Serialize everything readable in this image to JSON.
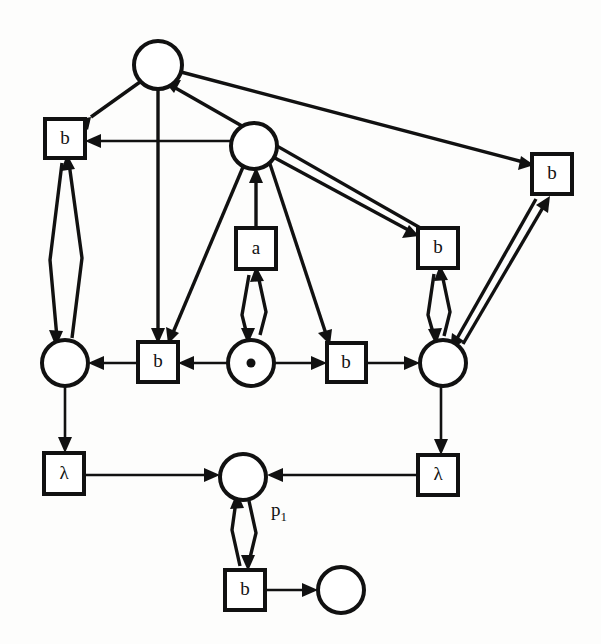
{
  "diagram": {
    "width": 601,
    "height": 644,
    "colors": {
      "stroke": "#111111",
      "fill": "#ffffff",
      "background": "#fdfdfc"
    },
    "places": [
      {
        "id": "p_top",
        "label": "",
        "tokens": 0,
        "cx": 158,
        "cy": 65,
        "r": 24
      },
      {
        "id": "p_mid_upper",
        "label": "",
        "tokens": 0,
        "cx": 254,
        "cy": 146,
        "r": 23
      },
      {
        "id": "p_left",
        "label": "",
        "tokens": 0,
        "cx": 65,
        "cy": 363,
        "r": 23
      },
      {
        "id": "p_token",
        "label": "",
        "tokens": 1,
        "cx": 251,
        "cy": 363,
        "r": 23
      },
      {
        "id": "p_right",
        "label": "",
        "tokens": 0,
        "cx": 443,
        "cy": 363,
        "r": 23
      },
      {
        "id": "p_1",
        "label": "p",
        "sub": "1",
        "tokens": 0,
        "cx": 243,
        "cy": 477,
        "r": 23
      },
      {
        "id": "p_bottom_right",
        "label": "",
        "tokens": 0,
        "cx": 341,
        "cy": 590,
        "r": 23
      }
    ],
    "transitions": [
      {
        "id": "t_b_left_top",
        "label": "b",
        "x": 45,
        "y": 119,
        "w": 40,
        "h": 39
      },
      {
        "id": "t_b_far_right",
        "label": "b",
        "x": 532,
        "y": 154,
        "w": 40,
        "h": 40
      },
      {
        "id": "t_a",
        "label": "a",
        "x": 236,
        "y": 228,
        "w": 40,
        "h": 41
      },
      {
        "id": "t_b_right_upper",
        "label": "b",
        "x": 418,
        "y": 228,
        "w": 40,
        "h": 40
      },
      {
        "id": "t_b_mid_left",
        "label": "b",
        "x": 138,
        "y": 342,
        "w": 40,
        "h": 40
      },
      {
        "id": "t_b_mid_right",
        "label": "b",
        "x": 327,
        "y": 343,
        "w": 39,
        "h": 39
      },
      {
        "id": "t_lambda_left",
        "label": "λ",
        "x": 44,
        "y": 453,
        "w": 40,
        "h": 41
      },
      {
        "id": "t_lambda_right",
        "label": "λ",
        "x": 418,
        "y": 455,
        "w": 40,
        "h": 40
      },
      {
        "id": "t_b_bottom",
        "label": "b",
        "x": 225,
        "y": 570,
        "w": 40,
        "h": 40
      }
    ],
    "arcs": [
      {
        "from": "p_top",
        "to": "t_b_left_top",
        "kind": "directed"
      },
      {
        "from": "p_top",
        "to": "t_b_mid_left",
        "kind": "directed"
      },
      {
        "from": "p_top",
        "to": "t_b_far_right",
        "kind": "directed"
      },
      {
        "from": "t_b_right_upper",
        "to": "p_top",
        "kind": "directed"
      },
      {
        "from": "p_mid_upper",
        "to": "t_b_left_top",
        "kind": "directed"
      },
      {
        "from": "p_mid_upper",
        "to": "t_b_mid_left",
        "kind": "directed"
      },
      {
        "from": "p_mid_upper",
        "to": "t_b_right_upper",
        "kind": "directed"
      },
      {
        "from": "p_mid_upper",
        "to": "t_b_mid_right",
        "kind": "directed"
      },
      {
        "from": "t_a",
        "to": "p_mid_upper",
        "kind": "directed"
      },
      {
        "from": "t_b_left_top",
        "to": "p_left",
        "kind": "bidirectional"
      },
      {
        "from": "t_a",
        "to": "p_token",
        "kind": "bidirectional"
      },
      {
        "from": "t_b_right_upper",
        "to": "p_right",
        "kind": "bidirectional"
      },
      {
        "from": "t_b_far_right",
        "to": "p_right",
        "kind": "bidirectional"
      },
      {
        "from": "t_b_mid_left",
        "to": "p_left",
        "kind": "directed"
      },
      {
        "from": "p_token",
        "to": "t_b_mid_left",
        "kind": "directed"
      },
      {
        "from": "p_token",
        "to": "t_b_mid_right",
        "kind": "directed"
      },
      {
        "from": "t_b_mid_right",
        "to": "p_right",
        "kind": "directed"
      },
      {
        "from": "p_left",
        "to": "t_lambda_left",
        "kind": "directed"
      },
      {
        "from": "p_right",
        "to": "t_lambda_right",
        "kind": "directed"
      },
      {
        "from": "t_lambda_left",
        "to": "p_1",
        "kind": "directed"
      },
      {
        "from": "t_lambda_right",
        "to": "p_1",
        "kind": "directed"
      },
      {
        "from": "p_1",
        "to": "t_b_bottom",
        "kind": "bidirectional"
      },
      {
        "from": "t_b_bottom",
        "to": "p_bottom_right",
        "kind": "directed"
      }
    ]
  }
}
